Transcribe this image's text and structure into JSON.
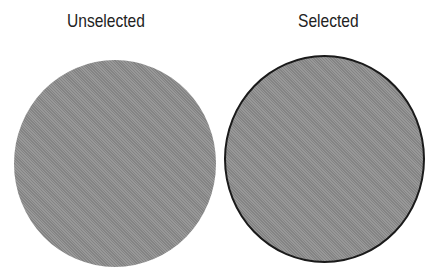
{
  "labels": {
    "unselected": "Unselected",
    "selected": "Selected"
  },
  "states": [
    {
      "name": "unselected",
      "fill": "#8f8f8f",
      "outline": "none"
    },
    {
      "name": "selected",
      "fill": "#8f8f8f",
      "outline": "#1a1a1a"
    }
  ]
}
